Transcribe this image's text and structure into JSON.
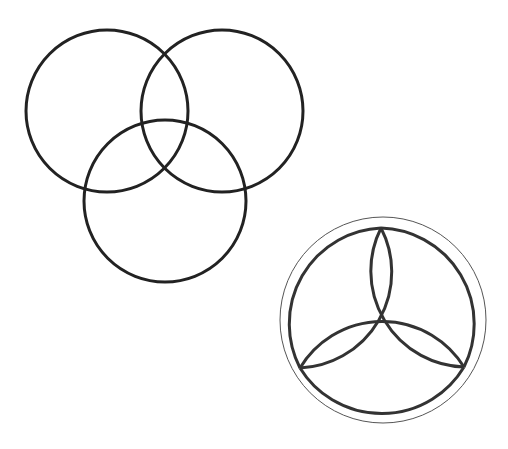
{
  "diagrams": [
    {
      "name": "venn-three-circles",
      "stroke": "#222222",
      "stroke_width": 3,
      "circles": [
        {
          "cx": 107,
          "cy": 111,
          "r": 81
        },
        {
          "cx": 222,
          "cy": 111,
          "r": 81
        },
        {
          "cx": 165,
          "cy": 201,
          "r": 81
        }
      ]
    },
    {
      "name": "triquetra-in-circle",
      "outer_circle": {
        "cx": 383,
        "cy": 320,
        "r": 103,
        "stroke": "#555555",
        "stroke_width": 1
      },
      "stroke": "#333333",
      "stroke_width": 3,
      "tips": {
        "top": [
          381,
          228
        ],
        "left": [
          300,
          368
        ],
        "right": [
          464,
          367
        ]
      },
      "arc_radius": 96
    }
  ]
}
